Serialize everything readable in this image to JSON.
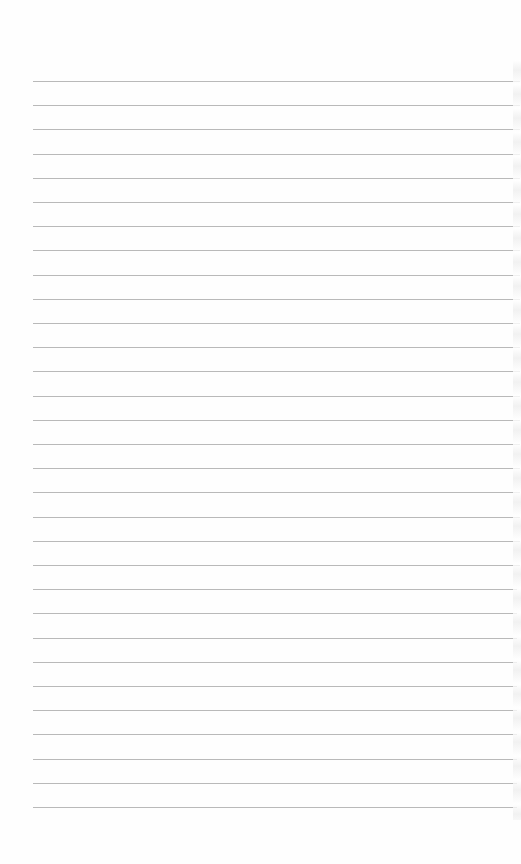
{
  "page": {
    "type": "lined notebook paper",
    "line_color": "#b9b9b9",
    "background": "#fefefe",
    "line_count": 31,
    "first_line_y": 81,
    "line_spacing": 24.2,
    "line_left": 33,
    "line_right": 520
  }
}
